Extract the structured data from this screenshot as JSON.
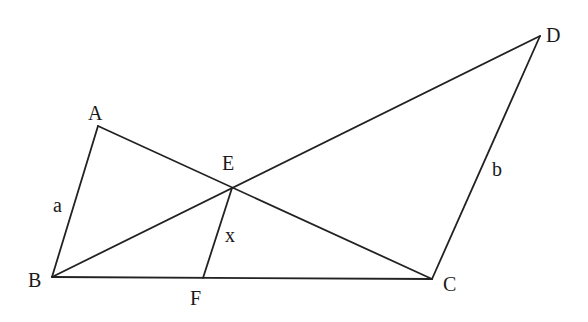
{
  "diagram": {
    "type": "geometry",
    "points": {
      "A": {
        "label": "A",
        "x": 98,
        "y": 126,
        "lx": 88,
        "ly": 120
      },
      "B": {
        "label": "B",
        "x": 52,
        "y": 277,
        "lx": 28,
        "ly": 287
      },
      "C": {
        "label": "C",
        "x": 432,
        "y": 279,
        "lx": 443,
        "ly": 291
      },
      "D": {
        "label": "D",
        "x": 540,
        "y": 36,
        "lx": 546,
        "ly": 42
      },
      "E": {
        "label": "E",
        "x": 232,
        "y": 188,
        "lx": 222,
        "ly": 170
      },
      "F": {
        "label": "F",
        "x": 203,
        "y": 278,
        "lx": 190,
        "ly": 305
      }
    },
    "segments": [
      {
        "name": "AB",
        "from": "A",
        "to": "B"
      },
      {
        "name": "AC",
        "from": "A",
        "to": "C"
      },
      {
        "name": "BD",
        "from": "B",
        "to": "D"
      },
      {
        "name": "BC",
        "from": "B",
        "to": "C"
      },
      {
        "name": "CD",
        "from": "C",
        "to": "D"
      },
      {
        "name": "EF",
        "from": "E",
        "to": "F"
      }
    ],
    "side_labels": {
      "a": {
        "text": "a",
        "x": 53,
        "y": 212
      },
      "b": {
        "text": "b",
        "x": 492,
        "y": 176
      },
      "x": {
        "text": "x",
        "x": 225,
        "y": 242
      }
    }
  }
}
